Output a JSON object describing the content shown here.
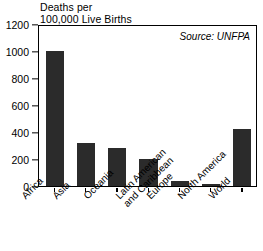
{
  "chart_data": {
    "type": "bar",
    "title": "Deaths per 100,000 Live Births",
    "title_lines": [
      "Deaths per",
      "100,000 Live Births"
    ],
    "xlabel": "",
    "ylabel": "Deaths per 100,000 Live Births",
    "ylim": [
      0,
      1200
    ],
    "yticks": [
      0,
      200,
      400,
      600,
      800,
      1000,
      1200
    ],
    "ytick_labels": [
      "0",
      "200",
      "400",
      "600",
      "800",
      "1000",
      "1200"
    ],
    "grid": false,
    "legend": "none",
    "annotation": "Source: UNFPA",
    "bar_color": "#2b2b2b",
    "categories": [
      "Africa",
      "Asia",
      "Oceania",
      "Latin American and Caribbean",
      "Europe",
      "North America",
      "World"
    ],
    "category_lines": [
      [
        "Africa"
      ],
      [
        "Asia"
      ],
      [
        "Oceania"
      ],
      [
        "Latin American",
        "and Caribbean"
      ],
      [
        "Europe"
      ],
      [
        "North America"
      ],
      [
        "World"
      ]
    ],
    "values": [
      1000,
      320,
      280,
      200,
      36,
      16,
      420
    ]
  }
}
